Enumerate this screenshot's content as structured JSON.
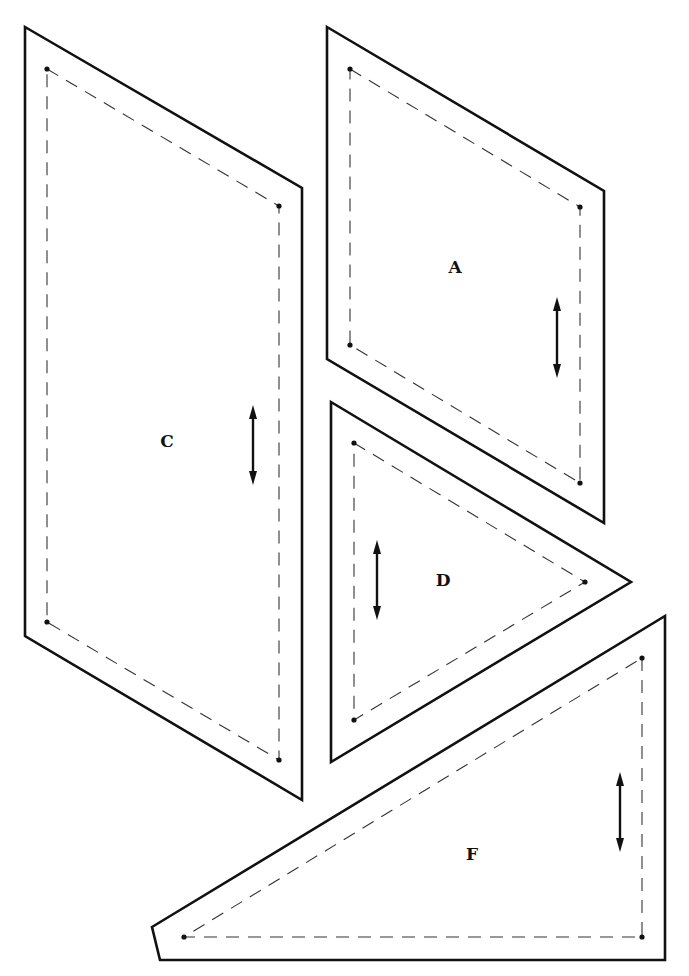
{
  "diagram": {
    "type": "quilt-pattern-templates",
    "colors": {
      "background": "#ffffff",
      "line": "#111111"
    },
    "pieces": [
      {
        "label": "C",
        "label_pos": [
          167,
          442
        ],
        "cut_line": [
          [
            25,
            27
          ],
          [
            302,
            188
          ],
          [
            302,
            800
          ],
          [
            25,
            636
          ]
        ],
        "seam_line": [
          [
            47,
            69
          ],
          [
            279,
            206
          ],
          [
            279,
            760
          ],
          [
            47,
            622
          ]
        ],
        "grain_arrow": {
          "x": 253,
          "y1": 405,
          "y2": 485
        }
      },
      {
        "label": "A",
        "label_pos": [
          455,
          268
        ],
        "cut_line": [
          [
            327,
            27
          ],
          [
            604,
            191
          ],
          [
            604,
            523
          ],
          [
            327,
            359
          ]
        ],
        "seam_line": [
          [
            350,
            69
          ],
          [
            580,
            207
          ],
          [
            580,
            483
          ],
          [
            350,
            345
          ]
        ],
        "grain_arrow": {
          "x": 557,
          "y1": 297,
          "y2": 378
        }
      },
      {
        "label": "D",
        "label_pos": [
          443,
          581
        ],
        "cut_line": [
          [
            331,
            402
          ],
          [
            631,
            582
          ],
          [
            331,
            762
          ]
        ],
        "seam_line": [
          [
            354,
            443
          ],
          [
            585,
            582
          ],
          [
            354,
            720
          ]
        ],
        "grain_arrow": {
          "x": 377,
          "y1": 540,
          "y2": 620
        }
      },
      {
        "label": "F",
        "label_pos": [
          472,
          855
        ],
        "cut_line": [
          [
            665,
            616
          ],
          [
            665,
            960
          ],
          [
            160,
            960
          ],
          [
            152,
            927
          ]
        ],
        "seam_line": [
          [
            642,
            658
          ],
          [
            642,
            937
          ],
          [
            184,
            937
          ]
        ],
        "grain_arrow": {
          "x": 620,
          "y1": 772,
          "y2": 852
        }
      }
    ]
  }
}
